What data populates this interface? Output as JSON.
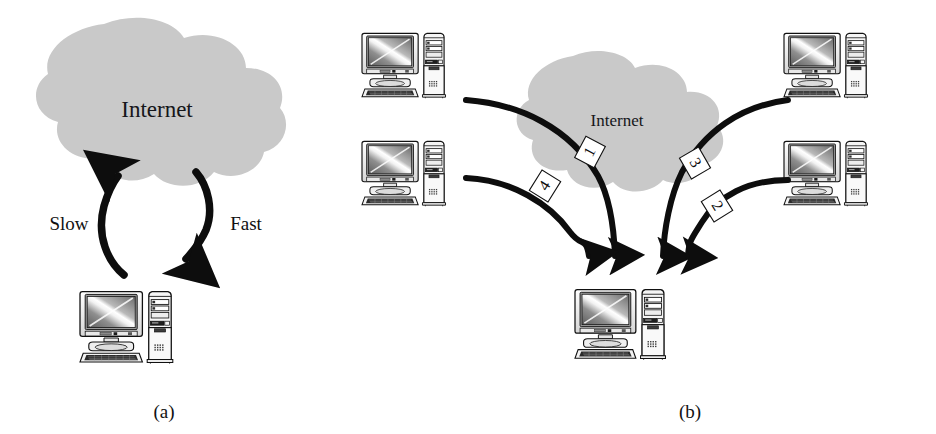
{
  "figure": {
    "background_color": "#ffffff",
    "ink_color": "#111111",
    "cloud_fill": "#c9c9c9",
    "cloud_stroke": "none",
    "label_box_fill": "#ffffff",
    "label_box_stroke": "#111111"
  },
  "panels": [
    {
      "id": "a",
      "caption": "(a)",
      "cloud": {
        "label": "Internet",
        "font_size": 23
      },
      "arrows": [
        {
          "name": "slow-arrow",
          "label": "Slow",
          "direction": "up"
        },
        {
          "name": "fast-arrow",
          "label": "Fast",
          "direction": "down"
        }
      ],
      "computers": [
        {
          "name": "client-computer",
          "position": "bottom"
        }
      ]
    },
    {
      "id": "b",
      "caption": "(b)",
      "cloud": {
        "label": "Internet",
        "font_size": 17
      },
      "computers": [
        {
          "name": "server-computer-top-left",
          "position": "top-left"
        },
        {
          "name": "server-computer-bottom-left",
          "position": "bottom-left"
        },
        {
          "name": "server-computer-top-right",
          "position": "top-right"
        },
        {
          "name": "server-computer-bottom-right",
          "position": "bottom-right"
        },
        {
          "name": "client-computer",
          "position": "bottom-center"
        }
      ],
      "streams": [
        {
          "name": "stream-1",
          "number": "1",
          "source": "top-left"
        },
        {
          "name": "stream-4",
          "number": "4",
          "source": "bottom-left"
        },
        {
          "name": "stream-3",
          "number": "3",
          "source": "top-right"
        },
        {
          "name": "stream-2",
          "number": "2",
          "source": "bottom-right"
        }
      ]
    }
  ]
}
